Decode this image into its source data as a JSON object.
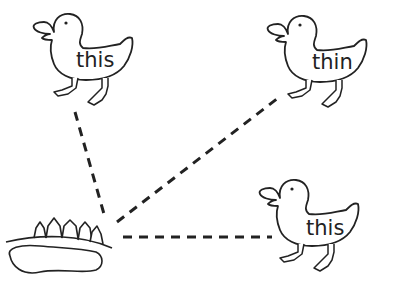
{
  "worksheet": {
    "ducks": [
      {
        "id": "duck-top-left",
        "word": "this"
      },
      {
        "id": "duck-top-right",
        "word": "thin"
      },
      {
        "id": "duck-bottom-right",
        "word": "this"
      }
    ],
    "pond": {
      "label": "pond-with-trees"
    },
    "colors": {
      "ink": "#222222",
      "background": "#ffffff"
    }
  }
}
